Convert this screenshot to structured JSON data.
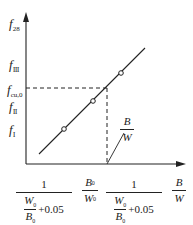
{
  "diagram": {
    "type": "line-graph",
    "y_axis": {
      "labels": [
        {
          "main": "f",
          "sub": "28"
        },
        {
          "main": "f",
          "sub": "Ⅲ"
        },
        {
          "main": "f",
          "sub": "cu,0"
        },
        {
          "main": "f",
          "sub": "Ⅱ"
        },
        {
          "main": "f",
          "sub": "Ⅰ"
        }
      ]
    },
    "x_axis": {
      "label_1": {
        "num": "1",
        "inner_num": "W",
        "inner_num_sub": "0",
        "inner_den": "B",
        "inner_den_sub": "0",
        "suffix": "+0.05"
      },
      "label_2": {
        "num": "B",
        "num_sub": "0",
        "den": "W",
        "den_sub": "0"
      },
      "label_3": {
        "num": "1",
        "inner_num": "W",
        "inner_num_sub": "0",
        "inner_den": "B",
        "inner_den_sub": "0",
        "suffix": "+0.05"
      },
      "axis_title": {
        "num": "B",
        "den": "W"
      }
    },
    "annotation": {
      "num": "B",
      "den": "W"
    },
    "data_points": 3,
    "colors": {
      "line": "#222222",
      "background": "#ffffff"
    }
  }
}
